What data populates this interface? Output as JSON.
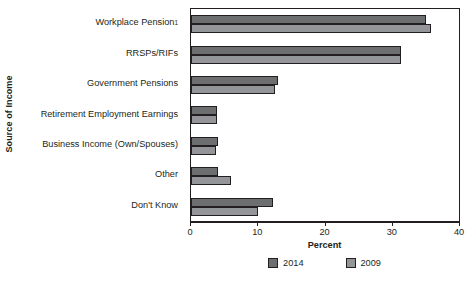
{
  "chart_data": {
    "type": "bar",
    "orientation": "horizontal",
    "title": "",
    "xlabel": "Percent",
    "ylabel": "Source of Income",
    "xlim": [
      0,
      40
    ],
    "xticks": [
      0,
      10,
      20,
      30,
      40
    ],
    "xtick_labels": [
      "0",
      "10",
      "20",
      "30",
      "40"
    ],
    "grid": false,
    "legend_position": "bottom-center",
    "categories": [
      "Workplace Pension",
      "RRSPs/RIFs",
      "Government Pensions",
      "Retirement Employment Earnings",
      "Business Income (Own/Spouses)",
      "Other",
      "Don't Know"
    ],
    "category_footnotes": [
      "1",
      "",
      "",
      "",
      "",
      "",
      ""
    ],
    "series": [
      {
        "name": "2014",
        "color": "#6d6e70",
        "values": [
          35.1,
          31.3,
          13.0,
          3.9,
          4.0,
          4.0,
          12.2
        ]
      },
      {
        "name": "2009",
        "color": "#939598",
        "values": [
          35.8,
          31.3,
          12.5,
          3.9,
          3.8,
          6.0,
          10.0
        ]
      }
    ]
  },
  "axis": {
    "y_title": "Source of Income",
    "x_title": "Percent"
  }
}
